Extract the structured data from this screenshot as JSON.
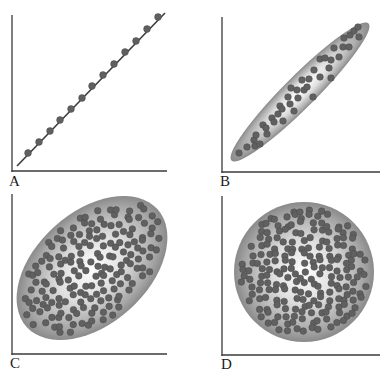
{
  "figure": {
    "colors": {
      "axis": "#3a3a3a",
      "dot": "#606060",
      "dot_stroke": "#4a4a4a",
      "line": "#3c3c3c",
      "shade_center": "#ffffff",
      "shade_edge": "#8a8a8a"
    },
    "panels": [
      {
        "id": "A",
        "label": "A",
        "kind": "perfect-linear",
        "axes": {
          "x0": 12,
          "y_top": 15,
          "y_axis_bottom": 171,
          "x_end": 167
        },
        "label_pos": {
          "x": 9,
          "y": 174
        },
        "line": {
          "x1": 17,
          "y1": 166,
          "x2": 165,
          "y2": 13
        },
        "dots": [
          [
            28,
            153
          ],
          [
            39,
            142
          ],
          [
            50,
            131
          ],
          [
            60,
            120
          ],
          [
            71,
            109
          ],
          [
            82,
            98
          ],
          [
            92,
            86
          ],
          [
            103,
            75
          ],
          [
            114,
            64
          ],
          [
            125,
            52
          ],
          [
            136,
            41
          ],
          [
            147,
            29
          ],
          [
            158,
            17
          ]
        ]
      },
      {
        "id": "B",
        "label": "B",
        "kind": "strong-positive",
        "axes": {
          "x0": 222,
          "y_top": 17,
          "y_axis_bottom": 172,
          "x_end": 380
        },
        "label_pos": {
          "x": 220,
          "y": 174
        },
        "envelope": {
          "cx": 300,
          "cy": 92,
          "rx": 97,
          "ry": 16,
          "angle": -45
        },
        "dots": [
          [
            239,
            153
          ],
          [
            247,
            147
          ],
          [
            254,
            140
          ],
          [
            255,
            146
          ],
          [
            260,
            144
          ],
          [
            256,
            135
          ],
          [
            263,
            125
          ],
          [
            267,
            134
          ],
          [
            266,
            128
          ],
          [
            272,
            118
          ],
          [
            274,
            122
          ],
          [
            278,
            114
          ],
          [
            280,
            106
          ],
          [
            282,
            109
          ],
          [
            283,
            121
          ],
          [
            288,
            97
          ],
          [
            290,
            104
          ],
          [
            294,
            111
          ],
          [
            298,
            98
          ],
          [
            291,
            88
          ],
          [
            297,
            90
          ],
          [
            304,
            90
          ],
          [
            302,
            80
          ],
          [
            307,
            87
          ],
          [
            309,
            79
          ],
          [
            314,
            70
          ],
          [
            313,
            97
          ],
          [
            320,
            59
          ],
          [
            320,
            77
          ],
          [
            325,
            58
          ],
          [
            329,
            68
          ],
          [
            331,
            78
          ],
          [
            334,
            48
          ],
          [
            331,
            60
          ],
          [
            339,
            57
          ],
          [
            343,
            47
          ],
          [
            349,
            47
          ],
          [
            344,
            38
          ],
          [
            350,
            35
          ],
          [
            354,
            31
          ],
          [
            359,
            37
          ],
          [
            358,
            27
          ]
        ]
      },
      {
        "id": "C",
        "label": "C",
        "kind": "moderate-positive",
        "axes": {
          "x0": 12,
          "y_top": 194,
          "y_axis_bottom": 354,
          "x_end": 167
        },
        "label_pos": {
          "x": 10,
          "y": 356
        },
        "envelope": {
          "cx": 92,
          "cy": 268,
          "rx": 88,
          "ry": 56,
          "angle": -42
        }
      },
      {
        "id": "D",
        "label": "D",
        "kind": "no-correlation",
        "axes": {
          "x0": 222,
          "y_top": 196,
          "y_axis_bottom": 355,
          "x_end": 380
        },
        "label_pos": {
          "x": 221,
          "y": 357
        },
        "envelope": {
          "cx": 304,
          "cy": 272,
          "rx": 70,
          "ry": 70,
          "angle": 0
        }
      }
    ]
  }
}
